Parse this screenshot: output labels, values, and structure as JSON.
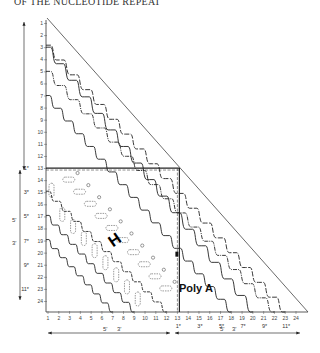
{
  "header": {
    "title": "OF THE NUCLEOTIDE REPEAT"
  },
  "diagram": {
    "y_axis_ticks": [
      "1",
      "2",
      "3",
      "4",
      "5",
      "6",
      "7",
      "8",
      "9",
      "10",
      "11",
      "12",
      "13",
      "14",
      "15",
      "16",
      "17",
      "18",
      "19",
      "20",
      "21",
      "22",
      "23",
      "24"
    ],
    "x_axis_ticks": [
      "1",
      "2",
      "3",
      "4",
      "5",
      "6",
      "7",
      "8",
      "9",
      "10",
      "11",
      "12",
      "13",
      "14",
      "15",
      "16",
      "17",
      "18",
      "19",
      "20",
      "21",
      "22",
      "23",
      "24"
    ],
    "y_sub_labels": [
      {
        "row": 13,
        "label": "1*"
      },
      {
        "row": 15,
        "label": "3*"
      },
      {
        "row": 17,
        "label": "5*"
      },
      {
        "row": 19,
        "label": "7*"
      },
      {
        "row": 21,
        "label": "9*"
      },
      {
        "row": 23,
        "label": "11*"
      }
    ],
    "x_sub_labels": [
      {
        "col": 13,
        "label": "1*"
      },
      {
        "col": 15,
        "label": "3*"
      },
      {
        "col": 17,
        "label": "5*"
      },
      {
        "col": 19,
        "label": "7*"
      },
      {
        "col": 21,
        "label": "9*"
      },
      {
        "col": 23,
        "label": "11*"
      }
    ],
    "region_label": "Poly A",
    "hairpin_symbol": "H",
    "arrow_labels": {
      "left_5prime": "5'",
      "left_3prime": "3'",
      "bottom_left_5prime": "5'",
      "bottom_left_3prime": "3'",
      "bottom_right_5prime": "5'",
      "bottom_right_3prime": "3'"
    },
    "colors": {
      "ink": "#222222",
      "background": "#ffffff"
    }
  }
}
